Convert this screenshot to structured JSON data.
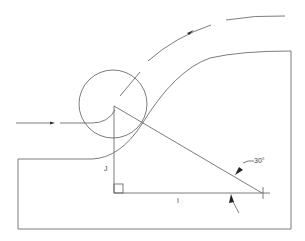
{
  "diagram": {
    "labels": {
      "angle": "30°",
      "vertical_leg": "J",
      "horizontal_leg": "I"
    },
    "elements": [
      "tool-circle",
      "workpiece-profile",
      "tool-path-arc",
      "approach-arrow",
      "right-triangle",
      "right-angle-marker",
      "angle-leader-arrows"
    ],
    "colors": {
      "line": "#5a5a5a",
      "text": "#444444",
      "background": "#ffffff"
    }
  }
}
